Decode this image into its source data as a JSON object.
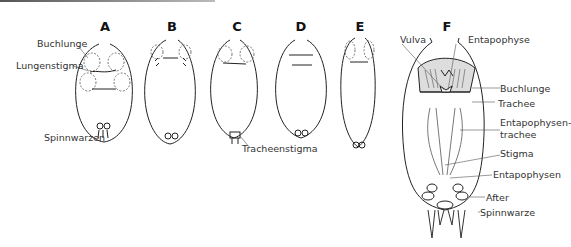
{
  "panels": [
    {
      "id": "A",
      "x": 105
    },
    {
      "id": "B",
      "x": 172
    },
    {
      "id": "C",
      "x": 236
    },
    {
      "id": "D",
      "x": 301
    },
    {
      "id": "E",
      "x": 360
    },
    {
      "id": "F",
      "x": 447
    }
  ],
  "labels": {
    "a_buchlunge": "Buchlunge",
    "a_lungenstigma": "Lungenstigma",
    "a_spinnwarzen": "Spinnwarzen",
    "c_tracheenstigma": "Tracheenstigma",
    "f_vulva": "Vulva",
    "f_entapophyse": "Entapophyse",
    "f_buchlunge": "Buchlunge",
    "f_trachee": "Trachee",
    "f_entapophysentrachee_1": "Entapophysen-",
    "f_entapophysentrachee_2": "trachee",
    "f_stigma": "Stigma",
    "f_entapophysen": "Entapophysen",
    "f_after": "After",
    "f_spinnwarze": "Spinnwarze"
  }
}
